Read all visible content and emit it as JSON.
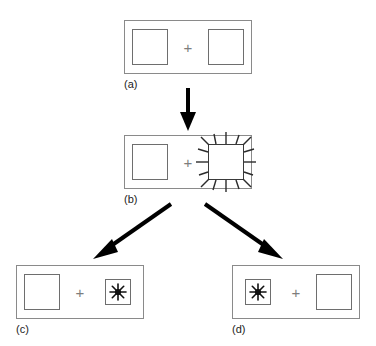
{
  "figure": {
    "background_color": "#ffffff",
    "frame_color": "#8a8a8a",
    "square_outline_color": "#6e6e6e",
    "spike_color": "#2b2b2b",
    "arrow_color": "#000000",
    "plus_color": "#7d7d7d"
  },
  "panels": [
    {
      "id": "a",
      "label": "(a)",
      "operator": "+",
      "left_item": {
        "icon": "plain-square-icon",
        "size": "large",
        "state": "plain"
      },
      "right_item": {
        "icon": "plain-square-icon",
        "size": "large",
        "state": "plain"
      }
    },
    {
      "id": "b",
      "label": "(b)",
      "operator": "+",
      "left_item": {
        "icon": "plain-square-icon",
        "size": "large",
        "state": "plain"
      },
      "right_item": {
        "icon": "spiky-square-icon",
        "size": "large",
        "state": "spiky"
      }
    },
    {
      "id": "c",
      "label": "(c)",
      "operator": "+",
      "left_item": {
        "icon": "plain-square-icon",
        "size": "large",
        "state": "plain"
      },
      "right_item": {
        "icon": "starburst-square-icon",
        "size": "small",
        "state": "starburst"
      }
    },
    {
      "id": "d",
      "label": "(d)",
      "operator": "+",
      "left_item": {
        "icon": "starburst-square-icon",
        "size": "small",
        "state": "starburst"
      },
      "right_item": {
        "icon": "plain-square-icon",
        "size": "large",
        "state": "plain"
      }
    }
  ],
  "arrows": [
    {
      "id": "a-to-b",
      "from": "a",
      "to": "b",
      "direction": "down"
    },
    {
      "id": "b-to-c",
      "from": "b",
      "to": "c",
      "direction": "down-left"
    },
    {
      "id": "b-to-d",
      "from": "b",
      "to": "d",
      "direction": "down-right"
    }
  ]
}
